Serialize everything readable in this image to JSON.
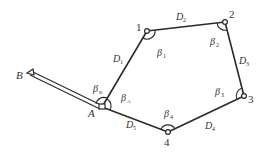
{
  "diagram": {
    "type": "closed traverse survey",
    "nodes": [
      {
        "id": "B",
        "label": "B",
        "x": 31,
        "y": 73
      },
      {
        "id": "A",
        "label": "A",
        "x": 102,
        "y": 107
      },
      {
        "id": "1",
        "label": "1",
        "x": 147,
        "y": 31
      },
      {
        "id": "2",
        "label": "2",
        "x": 225,
        "y": 22
      },
      {
        "id": "3",
        "label": "3",
        "x": 244,
        "y": 96
      },
      {
        "id": "4",
        "label": "4",
        "x": 168,
        "y": 132
      }
    ],
    "edges": [
      {
        "from": "A",
        "to": "1",
        "label": "D",
        "sub": "1"
      },
      {
        "from": "1",
        "to": "2",
        "label": "D",
        "sub": "2"
      },
      {
        "from": "2",
        "to": "3",
        "label": "D",
        "sub": "3"
      },
      {
        "from": "3",
        "to": "4",
        "label": "D",
        "sub": "4"
      },
      {
        "from": "4",
        "to": "A",
        "label": "D",
        "sub": "5"
      }
    ],
    "known_side": {
      "from": "B",
      "to": "A",
      "style": "double-line"
    },
    "angles": [
      {
        "at": "B-A-1",
        "label": "β",
        "sub": "B"
      },
      {
        "at": "A",
        "label": "β",
        "sub": "A"
      },
      {
        "at": "1",
        "label": "β",
        "sub": "1"
      },
      {
        "at": "2",
        "label": "β",
        "sub": "2"
      },
      {
        "at": "3",
        "label": "β",
        "sub": "3"
      },
      {
        "at": "4",
        "label": "β",
        "sub": "4"
      }
    ]
  },
  "labels": {
    "B": "B",
    "A": "A",
    "n1": "1",
    "n2": "2",
    "n3": "3",
    "n4": "4",
    "D": "D",
    "beta": "β",
    "s1": "1",
    "s2": "2",
    "s3": "3",
    "s4": "4",
    "s5": "5",
    "sA": "A",
    "sB": "B"
  }
}
